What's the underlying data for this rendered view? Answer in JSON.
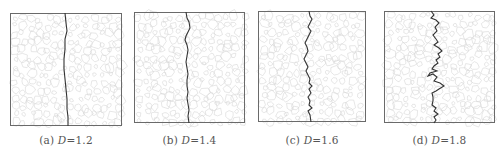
{
  "figure": {
    "panels": [
      {
        "id": "a",
        "label": "(a)",
        "var": "D",
        "eq": "=1.2",
        "value": 1.2,
        "box": [
          10,
          13,
          112,
          113
        ]
      },
      {
        "id": "b",
        "label": "(b)",
        "var": "D",
        "eq": "=1.4",
        "value": 1.4,
        "box": [
          134,
          12,
          111,
          111
        ]
      },
      {
        "id": "c",
        "label": "(c)",
        "var": "D",
        "eq": "=1.6",
        "value": 1.6,
        "box": [
          258,
          11,
          108,
          111
        ]
      },
      {
        "id": "d",
        "label": "(d)",
        "var": "D",
        "eq": "=1.8",
        "value": 1.8,
        "box": [
          384,
          11,
          111,
          112
        ]
      }
    ],
    "colors": {
      "frame": "#6a6a6a",
      "aggregate": "#d6d6d6",
      "crack": "#333333"
    }
  }
}
